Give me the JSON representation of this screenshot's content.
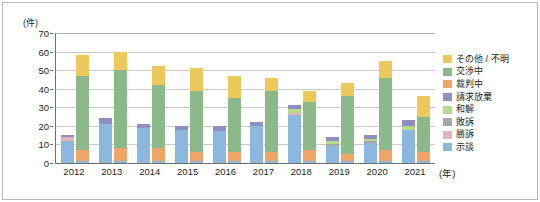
{
  "chart_data": {
    "type": "bar",
    "subtype": "grouped-stacked-bar",
    "title": "",
    "xlabel": "(年)",
    "ylabel": "(件)",
    "ylim": [
      0,
      70
    ],
    "ytick_step": 10,
    "yticks": [
      0,
      10,
      20,
      30,
      40,
      50,
      60,
      70
    ],
    "grid": true,
    "legend_position": "right",
    "categories": [
      "2012",
      "2013",
      "2014",
      "2015",
      "2016",
      "2017",
      "2018",
      "2019",
      "2020",
      "2021"
    ],
    "bars_per_category": 2,
    "stack_order_bottom_to_top": [
      "示談",
      "勝訴",
      "敗訴",
      "和解",
      "請求放棄",
      "裁判中",
      "交渉中",
      "その他 / 不明"
    ],
    "series": [
      {
        "name": "示談",
        "color": "#8cb8dd",
        "values_bar1": [
          12,
          21,
          19,
          18,
          17,
          20,
          26,
          9,
          11,
          18
        ],
        "values_bar2": [
          1,
          1,
          1,
          1,
          1,
          1,
          1,
          1,
          1,
          1
        ]
      },
      {
        "name": "勝訴",
        "color": "#e0b3bd",
        "values_bar1": [
          2,
          0,
          0,
          0,
          0,
          0,
          1,
          0,
          0,
          0
        ],
        "values_bar2": [
          0,
          0,
          0,
          0,
          0,
          0,
          0,
          0,
          0,
          0
        ]
      },
      {
        "name": "敗訴",
        "color": "#a6a6a6",
        "values_bar1": [
          0,
          0,
          0,
          0,
          0,
          0,
          0,
          1,
          1,
          0
        ],
        "values_bar2": [
          0,
          0,
          0,
          0,
          0,
          0,
          0,
          0,
          0,
          0
        ]
      },
      {
        "name": "和解",
        "color": "#b6d98a",
        "values_bar1": [
          0,
          0,
          0,
          0,
          0,
          0,
          2,
          2,
          1,
          2
        ],
        "values_bar2": [
          0,
          0,
          0,
          0,
          0,
          0,
          0,
          0,
          0,
          0
        ]
      },
      {
        "name": "請求放棄",
        "color": "#8e8fc0",
        "values_bar1": [
          1,
          3,
          2,
          2,
          3,
          2,
          2,
          2,
          2,
          3
        ],
        "values_bar2": [
          0,
          0,
          0,
          0,
          0,
          0,
          0,
          0,
          0,
          0
        ]
      },
      {
        "name": "裁判中",
        "color": "#efa46a",
        "values_bar1": [
          0,
          0,
          0,
          0,
          0,
          0,
          0,
          0,
          0,
          0
        ],
        "values_bar2": [
          6,
          7,
          7,
          5,
          5,
          5,
          6,
          4,
          6,
          5
        ]
      },
      {
        "name": "交渉中",
        "color": "#8cb98a",
        "values_bar1": [
          0,
          0,
          0,
          0,
          0,
          0,
          0,
          0,
          0,
          0
        ],
        "values_bar2": [
          40,
          42,
          34,
          33,
          29,
          33,
          26,
          31,
          39,
          19
        ]
      },
      {
        "name": "その他 / 不明",
        "color": "#edc95b",
        "values_bar1": [
          0,
          0,
          0,
          0,
          0,
          0,
          0,
          0,
          0,
          0
        ],
        "values_bar2": [
          11,
          10,
          10,
          12,
          12,
          7,
          6,
          7,
          9,
          11
        ]
      }
    ],
    "bar_totals": {
      "bar1": [
        15,
        24,
        21,
        20,
        20,
        22,
        31,
        14,
        15,
        23
      ],
      "bar2": [
        58,
        60,
        52,
        51,
        47,
        46,
        39,
        43,
        55,
        36
      ]
    }
  },
  "legend": {
    "items": [
      {
        "label": "その他 / 不明",
        "color": "#edc95b"
      },
      {
        "label": "交渉中",
        "color": "#8cb98a"
      },
      {
        "label": "裁判中",
        "color": "#efa46a"
      },
      {
        "label": "請求放棄",
        "color": "#8e8fc0"
      },
      {
        "label": "和解",
        "color": "#b6d98a"
      },
      {
        "label": "敗訴",
        "color": "#a6a6a6"
      },
      {
        "label": "勝訴",
        "color": "#e0b3bd"
      },
      {
        "label": "示談",
        "color": "#8cb8dd"
      }
    ]
  }
}
